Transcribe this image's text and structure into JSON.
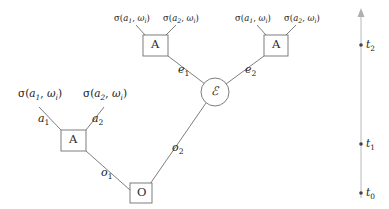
{
  "diagram": {
    "type": "tree-timeline-diagram",
    "nodes": [
      {
        "id": "origin",
        "label": "O",
        "shape": "square",
        "x": 141,
        "y": 193
      },
      {
        "id": "agent-left",
        "label": "A",
        "shape": "square",
        "x": 73.5,
        "y": 140.5
      },
      {
        "id": "env",
        "label": "ℰ",
        "shape": "circle",
        "x": 215,
        "y": 92
      },
      {
        "id": "agent-top-left",
        "label": "A",
        "shape": "square",
        "x": 155.5,
        "y": 45.5
      },
      {
        "id": "agent-top-right",
        "label": "A",
        "shape": "square",
        "x": 276,
        "y": 45.5
      }
    ],
    "edges": [
      {
        "id": "o1",
        "label": "o",
        "sub": "1",
        "from": "origin",
        "to": "agent-left"
      },
      {
        "id": "o2",
        "label": "o",
        "sub": "2",
        "from": "origin",
        "to": "env"
      },
      {
        "id": "e1",
        "label": "e",
        "sub": "1",
        "from": "env",
        "to": "agent-top-left"
      },
      {
        "id": "e2",
        "label": "e",
        "sub": "2",
        "from": "env",
        "to": "agent-top-right"
      },
      {
        "id": "a1",
        "label": "a",
        "sub": "1",
        "from": "agent-left",
        "to": "sigma-left-1"
      },
      {
        "id": "a2",
        "label": "a",
        "sub": "2",
        "from": "agent-left",
        "to": "sigma-left-2"
      }
    ],
    "sigma_labels": [
      {
        "id": "sigma-left-1",
        "sigma": "σ",
        "arg": "a",
        "arg_sub": "1",
        "omega": "ω",
        "omega_sub": "i",
        "size": "large"
      },
      {
        "id": "sigma-left-2",
        "sigma": "σ",
        "arg": "a",
        "arg_sub": "2",
        "omega": "ω",
        "omega_sub": "i",
        "size": "large"
      },
      {
        "id": "sigma-tl-1",
        "sigma": "σ",
        "arg": "a",
        "arg_sub": "1",
        "omega": "ω",
        "omega_sub": "i",
        "size": "small"
      },
      {
        "id": "sigma-tl-2",
        "sigma": "σ",
        "arg": "a",
        "arg_sub": "2",
        "omega": "ω",
        "omega_sub": "i",
        "size": "small"
      },
      {
        "id": "sigma-tr-1",
        "sigma": "σ",
        "arg": "a",
        "arg_sub": "1",
        "omega": "ω",
        "omega_sub": "i",
        "size": "small"
      },
      {
        "id": "sigma-tr-2",
        "sigma": "σ",
        "arg": "a",
        "arg_sub": "2",
        "omega": "ω",
        "omega_sub": "i",
        "size": "small"
      }
    ]
  },
  "timeline": {
    "orientation": "vertical",
    "direction": "upward",
    "ticks": [
      {
        "id": "t0",
        "label": "t",
        "sub": "0",
        "y": 193
      },
      {
        "id": "t1",
        "label": "t",
        "sub": "1",
        "y": 144
      },
      {
        "id": "t2",
        "label": "t",
        "sub": "2",
        "y": 45
      }
    ]
  },
  "colors": {
    "stroke": "#6f6f6f",
    "axis": "#b0b0b0",
    "text": "#1a1a1a",
    "dot": "#444444",
    "background": "#ffffff"
  }
}
